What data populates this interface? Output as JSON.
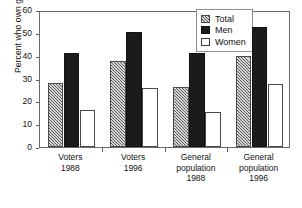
{
  "chart_data": {
    "type": "bar",
    "title": "",
    "xlabel": "",
    "ylabel": "Percent who own guns",
    "ylim": [
      0,
      60
    ],
    "yticks": [
      0,
      10,
      20,
      30,
      40,
      50,
      60
    ],
    "ytick_labels": [
      "0",
      "10",
      "20",
      "30",
      "40",
      "50",
      "60"
    ],
    "grid": false,
    "legend_position": "top-right",
    "categories": [
      "Voters\n1988",
      "Voters\n1996",
      "General\npopulation\n1988",
      "General\npopulation\n1996"
    ],
    "series": [
      {
        "name": "Total",
        "values": [
          28,
          37.5,
          26.5,
          40
        ],
        "fill": "hatched-gray",
        "color": "#d8d8d8"
      },
      {
        "name": "Men",
        "values": [
          41,
          50.5,
          41,
          52.5
        ],
        "fill": "solid-black",
        "color": "#1b1b1b"
      },
      {
        "name": "Women",
        "values": [
          16,
          26,
          15.5,
          27.5
        ],
        "fill": "white-outline",
        "color": "#ffffff"
      }
    ]
  },
  "legend": {
    "items": [
      {
        "label": "Total"
      },
      {
        "label": "Men"
      },
      {
        "label": "Women"
      }
    ]
  },
  "axis": {
    "y_title": "Percent who own guns"
  }
}
